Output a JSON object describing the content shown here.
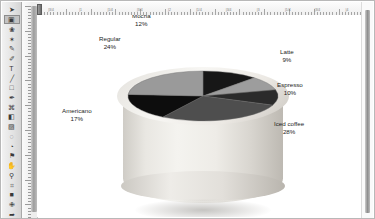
{
  "app": {
    "window_title": "Image editor canvas",
    "canvas_background": "#ffffff"
  },
  "toolbar": {
    "name": "tool-palette",
    "selected_index": 1,
    "tools": [
      {
        "name": "move-tool",
        "glyph": "➤"
      },
      {
        "name": "marquee-select-tool",
        "glyph": "▣"
      },
      {
        "name": "lasso-tool",
        "glyph": "❀"
      },
      {
        "name": "magic-wand-tool",
        "glyph": "✶"
      },
      {
        "name": "brush-tool",
        "glyph": "✎"
      },
      {
        "name": "pencil-tool",
        "glyph": "✐"
      },
      {
        "name": "type-tool",
        "glyph": "T"
      },
      {
        "name": "line-tool",
        "glyph": "╱"
      },
      {
        "name": "shape-tool",
        "glyph": "□"
      },
      {
        "name": "eyedropper-tool",
        "glyph": "✒"
      },
      {
        "name": "clone-stamp-tool",
        "glyph": "⌘"
      },
      {
        "name": "eraser-tool",
        "glyph": "◧"
      },
      {
        "name": "gradient-tool",
        "glyph": "▨"
      },
      {
        "name": "blur-tool",
        "glyph": "◌"
      },
      {
        "name": "dodge-tool",
        "glyph": "◔"
      },
      {
        "name": "paint-bucket-tool",
        "glyph": "⚑"
      },
      {
        "name": "hand-tool",
        "glyph": "✋"
      },
      {
        "name": "zoom-tool",
        "glyph": "⚲"
      },
      {
        "name": "crop-tool",
        "glyph": "⌗"
      },
      {
        "name": "foreground-color-swatch",
        "glyph": "■"
      },
      {
        "name": "healing-brush-tool",
        "glyph": "✙"
      },
      {
        "name": "path-select-tool",
        "glyph": "➦"
      }
    ]
  },
  "rulers": {
    "horizontal_labels": [
      "|3/4",
      "|1",
      "|1/4",
      "|3/4",
      "|2",
      "|1/4",
      "|3/4",
      "|3",
      "|1/4",
      "|3/4",
      "|4"
    ],
    "unit": "inches"
  },
  "chart_data": {
    "type": "pie",
    "title": "",
    "legend_position": "callout-labels",
    "slices": [
      {
        "label": "Mocha",
        "value": 12,
        "pct_text": "12%",
        "color": "#171717"
      },
      {
        "label": "Latte",
        "value": 9,
        "pct_text": "9%",
        "color": "#9d9d9d"
      },
      {
        "label": "Espresso",
        "value": 10,
        "pct_text": "10%",
        "color": "#2b2b2b"
      },
      {
        "label": "Iced coffee",
        "value": 28,
        "pct_text": "28%",
        "color": "#4e4e4e"
      },
      {
        "label": "Americano",
        "value": 17,
        "pct_text": "17%",
        "color": "#0d0d0d"
      },
      {
        "label": "Regular",
        "value": 24,
        "pct_text": "24%",
        "color": "#9a9a9a"
      }
    ],
    "total": 100,
    "start_angle_deg": -90,
    "direction": "clockwise"
  },
  "labels": {
    "mocha": {
      "name": "Mocha",
      "pct": "12%"
    },
    "regular": {
      "name": "Regular",
      "pct": "24%"
    },
    "latte": {
      "name": "Latte",
      "pct": "9%"
    },
    "espresso": {
      "name": "Espresso",
      "pct": "10%"
    },
    "iced_coffee": {
      "name": "Iced coffee",
      "pct": "28%"
    },
    "americano": {
      "name": "Americano",
      "pct": "17%"
    }
  },
  "artwork": {
    "name": "coffee-cup-3d-pie-illustration",
    "cup_color": "#eeece7"
  }
}
